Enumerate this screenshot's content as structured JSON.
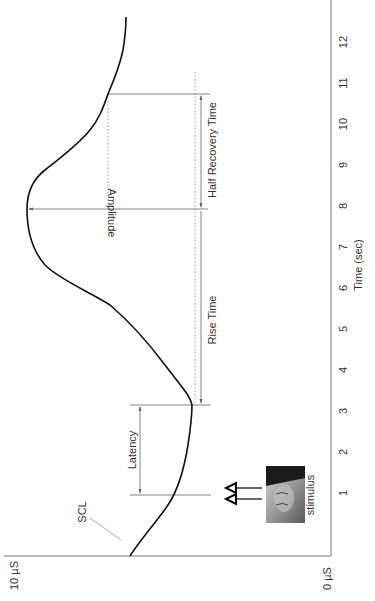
{
  "chart_data": {
    "type": "line",
    "orientation": "rotated-90-ccw",
    "title": "",
    "xlabel": "Time (sec)",
    "ylabel": "",
    "x_ticks": [
      1,
      2,
      3,
      4,
      5,
      6,
      7,
      8,
      9,
      10,
      11,
      12
    ],
    "y_tick_labels": [
      "0 µS",
      "10 µS"
    ],
    "ylim": [
      0,
      10
    ],
    "xlim": [
      -0.5,
      12.6
    ],
    "grid": false,
    "series": [
      {
        "name": "Skin conductance response",
        "x": [
          -0.54,
          0.5,
          1.0,
          1.5,
          2.3,
          3.15,
          3.5,
          4.1,
          5.0,
          5.7,
          6.2,
          6.7,
          7.2,
          7.9,
          8.4,
          9.0,
          9.8,
          10.7,
          11.7,
          12.6
        ],
        "values": [
          6.4,
          5.6,
          5.2,
          4.9,
          4.6,
          4.4,
          4.6,
          5.3,
          6.0,
          6.8,
          7.6,
          8.4,
          9.1,
          9.6,
          9.4,
          8.6,
          7.9,
          7.05,
          6.6,
          6.5
        ]
      }
    ],
    "annotations": [
      {
        "label": "SCL",
        "description": "Skin conductance level at start"
      },
      {
        "label": "stimulus",
        "time": 1.0
      },
      {
        "label": "Latency",
        "from_time": 1.0,
        "to_time": 3.15
      },
      {
        "label": "Rise Time",
        "from_time": 3.15,
        "to_time": 7.9
      },
      {
        "label": "Amplitude",
        "time": 7.9,
        "from_value": 4.4,
        "to_value": 9.6
      },
      {
        "label": "Half Recovery Time",
        "from_time": 7.9,
        "to_time": 10.7
      }
    ]
  },
  "labels": {
    "xlabel": "Time (sec)",
    "y_max": "10 µS",
    "y_min": "0 µS",
    "scl": "SCL",
    "stimulus": "stimulus",
    "latency": "Latency",
    "rise_time": "Rise Time",
    "amplitude": "Amplitude",
    "half_recovery": "Half Recovery Time",
    "ticks": [
      "1",
      "2",
      "3",
      "4",
      "5",
      "6",
      "7",
      "8",
      "9",
      "10",
      "11",
      "12"
    ]
  }
}
